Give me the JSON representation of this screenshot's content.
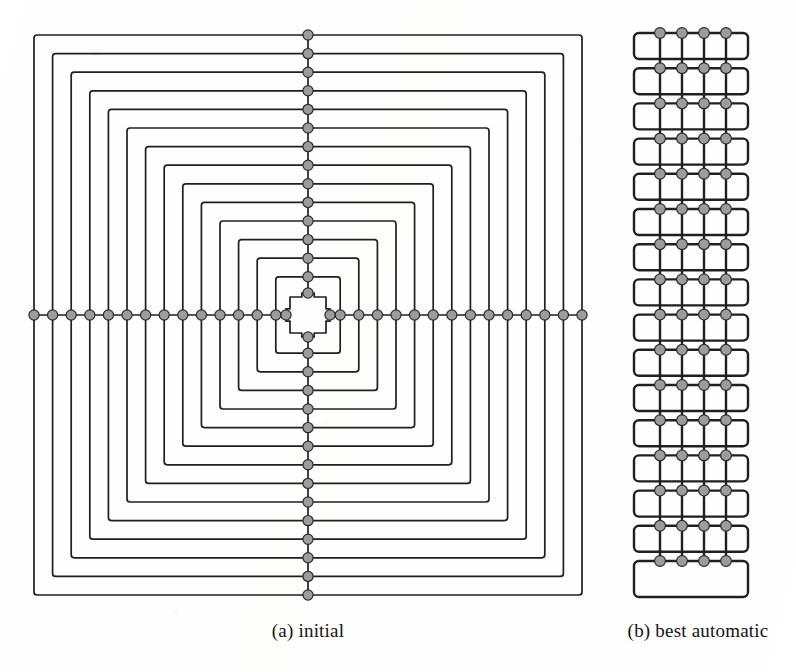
{
  "figure": {
    "kind": "two-panel circuit layout diagram",
    "background_color": "#ffffff",
    "line_color": "#1f1f1f",
    "node_fill_color": "#9c9c9c",
    "node_stroke_color": "#2a2a2a"
  },
  "captions": {
    "panel_a": "(a) initial",
    "panel_b": "(b) best automatic"
  },
  "panel_a": {
    "label": "initial",
    "description": "Concentric nested rounded squares with a vertical and horizontal spine of nodes through the centre",
    "ring_count": 15,
    "center_x": 308,
    "center_y": 315,
    "outer_half_width": 274,
    "outer_half_height": 280,
    "ring_step": 18.6,
    "corner_radius": 3,
    "stroke_width": 1.7,
    "node_radius": 5.1,
    "innermost_half_size": 18,
    "bounds": {
      "left": 34,
      "top": 32,
      "right": 583,
      "bottom": 592
    }
  },
  "panel_b": {
    "label": "best automatic",
    "description": "Vertical stack of rounded rectangular tracks crossed by four vertical nets with nodes at every crossing",
    "row_count": 16,
    "column_count": 4,
    "track_left": 14,
    "track_right": 128,
    "track_top": 33,
    "row_pitch": 35.2,
    "track_height": 26,
    "corner_radius": 5,
    "stroke_width": 2.4,
    "node_radius": 5.4,
    "column_x": [
      40,
      62,
      84,
      106
    ],
    "last_row_height": 36,
    "bounds": {
      "left": 634,
      "top": 33,
      "right": 748,
      "bottom": 598
    }
  }
}
